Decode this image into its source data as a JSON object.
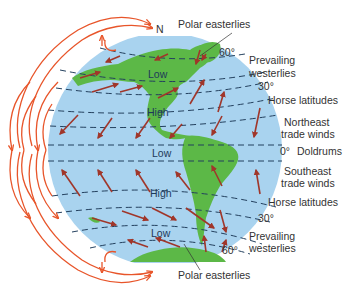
{
  "colors": {
    "ocean": "#a9d3ef",
    "land": "#5cb847",
    "surface_arrow": "#a0362a",
    "cell_arrow": "#e8552a",
    "dash": "#23405e",
    "label": "#333333"
  },
  "pole_label": "N",
  "pressure_zones": [
    {
      "label": "Low",
      "id": "low-60n"
    },
    {
      "label": "High",
      "id": "high-30n"
    },
    {
      "label": "Low",
      "id": "low-equator"
    },
    {
      "label": "High",
      "id": "high-30s"
    },
    {
      "label": "Low",
      "id": "low-60s"
    }
  ],
  "latitude_labels": {
    "n60": "60°",
    "n30": "30°",
    "eq": "0°",
    "s30": "30°",
    "s60": "60°"
  },
  "wind_labels": {
    "polar_easterlies_north": "Polar easterlies",
    "prevailing_westerlies_north": [
      "Prevailing",
      "westerlies"
    ],
    "horse_latitudes_north": "Horse latitudes",
    "northeast_trade_winds": [
      "Northeast",
      "trade winds"
    ],
    "doldrums": "Doldrums",
    "southeast_trade_winds": [
      "Southeast",
      "trade winds"
    ],
    "horse_latitudes_south": "Horse latitudes",
    "prevailing_westerlies_south": [
      "Prevailing",
      "westerlies"
    ],
    "polar_easterlies_south": "Polar easterlies"
  }
}
